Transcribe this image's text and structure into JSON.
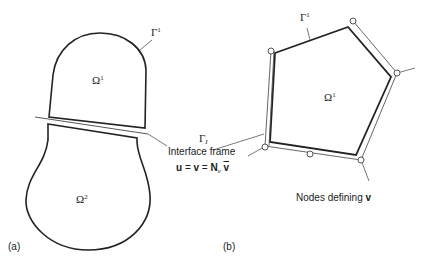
{
  "figure": {
    "panel_a": {
      "label": "(a)",
      "domain_upper": {
        "symbol": "Ω",
        "superscript": "1"
      },
      "domain_lower": {
        "symbol": "Ω",
        "superscript": "2"
      },
      "boundary_label": {
        "symbol": "Γ",
        "superscript": "1"
      }
    },
    "interface": {
      "symbol": "Γ",
      "subscript": "I",
      "caption": "Interface frame",
      "equation": {
        "u": "u",
        "eq1": " = ",
        "v": "v",
        "eq2": " = ",
        "N": "N",
        "N_sub": "v",
        "vbar": "v"
      }
    },
    "panel_b": {
      "label": "(b)",
      "domain": {
        "symbol": "Ω",
        "superscript": "1"
      },
      "boundary_label": {
        "symbol": "Γ",
        "superscript": "1"
      },
      "nodes_caption": "Nodes defining ",
      "nodes_caption_bold": "v"
    },
    "colors": {
      "stroke": "#222222",
      "thin_stroke": "#555555",
      "background": "#ffffff"
    }
  }
}
